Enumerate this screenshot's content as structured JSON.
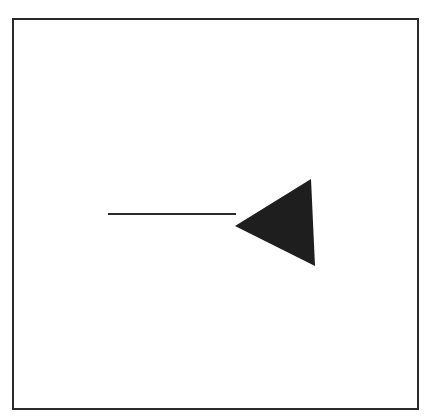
{
  "diagram": {
    "colors": {
      "stroke": "#2a2a2a",
      "fill": "#1e1e1e",
      "background": "#ffffff"
    },
    "frame": {
      "x": 12,
      "y": 18,
      "width": 407,
      "height": 392
    },
    "line": {
      "x1": 108,
      "y1": 214,
      "x2": 236,
      "y2": 214,
      "stroke_width": 2
    },
    "triangle": {
      "points": "235,226 311,179 315,266",
      "direction": "left"
    }
  }
}
